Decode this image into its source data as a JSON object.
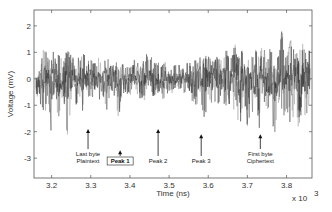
{
  "chart_data": {
    "type": "line",
    "title": "",
    "xlabel": "Time (ns)",
    "ylabel": "Voltage (mV)",
    "x_multiplier": "x 10^3",
    "x_multiplier_base": "x 10",
    "x_multiplier_exp": "3",
    "xlim": [
      3.155,
      3.865
    ],
    "ylim": [
      -3.75,
      2.6
    ],
    "xticks": [
      3.2,
      3.3,
      3.4,
      3.5,
      3.6,
      3.7,
      3.8
    ],
    "xtick_labels": [
      "3.2",
      "3.3",
      "3.4",
      "3.5",
      "3.6",
      "3.7",
      "3.8"
    ],
    "yticks": [
      2,
      1,
      0,
      -1,
      -2,
      -3
    ],
    "ytick_labels": [
      "2",
      "1",
      "0",
      "-1",
      "-2",
      "-3"
    ],
    "grid": false,
    "legend": null,
    "series": [
      {
        "name": "power trace",
        "color": "#222222",
        "x": [
          3.16,
          3.17,
          3.18,
          3.19,
          3.2,
          3.21,
          3.22,
          3.23,
          3.24,
          3.25,
          3.26,
          3.27,
          3.28,
          3.29,
          3.3,
          3.31,
          3.32,
          3.33,
          3.34,
          3.35,
          3.36,
          3.37,
          3.38,
          3.39,
          3.4,
          3.41,
          3.42,
          3.43,
          3.44,
          3.45,
          3.46,
          3.47,
          3.48,
          3.49,
          3.5,
          3.51,
          3.52,
          3.53,
          3.54,
          3.55,
          3.56,
          3.57,
          3.58,
          3.59,
          3.6,
          3.61,
          3.62,
          3.63,
          3.64,
          3.65,
          3.66,
          3.67,
          3.68,
          3.69,
          3.7,
          3.71,
          3.72,
          3.73,
          3.74,
          3.75,
          3.76,
          3.77,
          3.78,
          3.79,
          3.8,
          3.81,
          3.82,
          3.83,
          3.84,
          3.85,
          3.86
        ],
        "upper": [
          0.7,
          0.4,
          1.2,
          0.9,
          1.4,
          0.8,
          1.0,
          0.6,
          1.3,
          0.9,
          0.8,
          0.9,
          1.1,
          0.7,
          0.8,
          0.6,
          0.9,
          0.7,
          1.0,
          0.5,
          0.7,
          0.6,
          0.6,
          0.5,
          0.5,
          0.8,
          0.7,
          0.6,
          0.9,
          1.1,
          0.6,
          0.8,
          0.5,
          0.7,
          0.4,
          0.5,
          0.6,
          0.5,
          0.5,
          0.7,
          0.6,
          0.9,
          1.2,
          0.9,
          1.0,
          0.8,
          0.9,
          0.7,
          1.0,
          1.1,
          0.9,
          1.5,
          0.9,
          1.4,
          1.0,
          1.1,
          1.2,
          1.0,
          1.3,
          1.0,
          1.2,
          0.9,
          1.1,
          2.0,
          0.8,
          1.5,
          1.1,
          1.9,
          1.3,
          1.7,
          1.2
        ],
        "lower": [
          -0.6,
          -0.9,
          -1.6,
          -0.8,
          -2.5,
          -0.7,
          -1.9,
          -0.8,
          -2.4,
          -0.9,
          -1.2,
          -0.8,
          -1.3,
          -0.6,
          -1.0,
          -0.5,
          -0.9,
          -0.7,
          -1.5,
          -0.4,
          -0.8,
          -2.0,
          -0.6,
          -0.5,
          -0.7,
          -0.4,
          -0.6,
          -0.9,
          -1.0,
          -0.5,
          -0.7,
          -0.6,
          -0.4,
          -1.3,
          -0.5,
          -0.6,
          -0.4,
          -0.5,
          -0.6,
          -0.4,
          -0.9,
          -1.1,
          -0.6,
          -1.8,
          -0.6,
          -1.1,
          -1.0,
          -0.9,
          -1.2,
          -0.9,
          -1.4,
          -1.0,
          -2.3,
          -0.9,
          -1.9,
          -1.1,
          -1.7,
          -2.0,
          -1.2,
          -1.7,
          -1.5,
          -2.1,
          -1.0,
          -1.6,
          -1.2,
          -1.8,
          -1.4,
          -2.0,
          -1.3,
          -1.7,
          -1.1
        ]
      }
    ],
    "annotations": [
      {
        "label_lines": [
          "Last byte",
          "Plaintext"
        ],
        "x": 3.293,
        "arrow_tip_y": -1.9,
        "boxed": false
      },
      {
        "label_lines": [
          "Peak 1"
        ],
        "x": 3.375,
        "arrow_tip_y": -2.7,
        "boxed": true
      },
      {
        "label_lines": [
          "Peak 2"
        ],
        "x": 3.472,
        "arrow_tip_y": -1.9,
        "boxed": false
      },
      {
        "label_lines": [
          "Peak 3"
        ],
        "x": 3.582,
        "arrow_tip_y": -2.1,
        "boxed": false
      },
      {
        "label_lines": [
          "First byte",
          "Ciphertext"
        ],
        "x": 3.733,
        "arrow_tip_y": -2.1,
        "boxed": false
      }
    ]
  },
  "labels": {
    "xlabel": "Time (ns)",
    "ylabel": "Voltage (mV)",
    "x_multiplier_base": "x 10",
    "x_multiplier_exp": "3"
  }
}
